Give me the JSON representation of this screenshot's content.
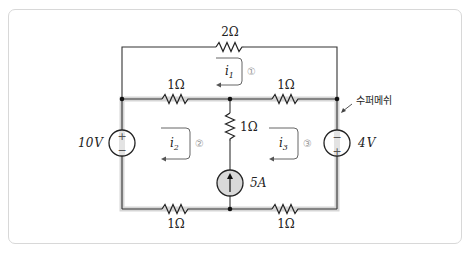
{
  "diagram": {
    "type": "circuit-schematic",
    "resistors": {
      "top": "2Ω",
      "middle_left": "1Ω",
      "middle_right": "1Ω",
      "center_vertical": "1Ω",
      "bottom_left": "1Ω",
      "bottom_right": "1Ω"
    },
    "sources": {
      "left_voltage": "10V",
      "right_voltage": "4V",
      "center_current": "5A"
    },
    "voltage_source_number": "10",
    "voltage_source_unit": "V",
    "right_source_number": "4",
    "right_source_unit": "V",
    "current_source_number": "5",
    "current_source_unit": "A",
    "meshes": [
      {
        "current": "i",
        "subscript": "1",
        "number": "①"
      },
      {
        "current": "i",
        "subscript": "2",
        "number": "②"
      },
      {
        "current": "i",
        "subscript": "3",
        "number": "③"
      }
    ],
    "supermesh_label": "수퍼메쉬",
    "left_source_polarity": {
      "top": "+",
      "bottom": "−"
    },
    "right_source_polarity": {
      "top": "−",
      "bottom": "+"
    },
    "colors": {
      "wire": "#333333",
      "supermesh_band": "#d4d4d4",
      "current_source_fill": "#d9d9d9",
      "mesh_arrow": "#666666",
      "mesh_number": "#999999"
    }
  }
}
